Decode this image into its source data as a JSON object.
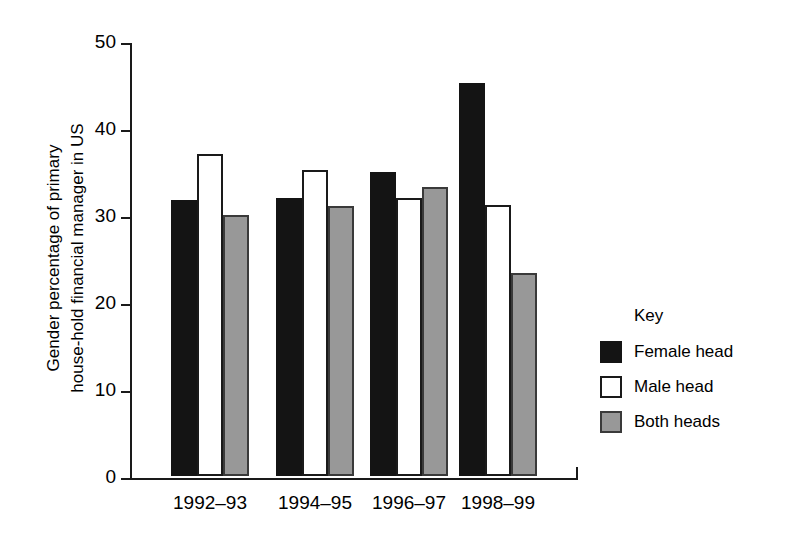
{
  "chart_data": {
    "type": "bar",
    "title": "",
    "subtitle": "",
    "xlabel": "",
    "ylabel": "Gender percentage of primary\nhouse-hold financial manager in US",
    "categories": [
      "1992–93",
      "1994–95",
      "1996–97",
      "1998–99"
    ],
    "series": [
      {
        "name": "Female head",
        "values": [
          31.7,
          32.0,
          35.0,
          45.2
        ],
        "color": "#141414"
      },
      {
        "name": "Male head",
        "values": [
          37.0,
          35.2,
          32.0,
          31.1
        ],
        "color": "#ffffff"
      },
      {
        "name": "Both heads",
        "values": [
          30.0,
          31.0,
          33.2,
          23.3
        ],
        "color": "#989898"
      }
    ],
    "ylim": [
      0,
      50
    ],
    "yticks": [
      0,
      10,
      20,
      30,
      40,
      50
    ],
    "ytick_labels": [
      "0",
      "10",
      "20",
      "30",
      "40",
      "50"
    ],
    "grid": false,
    "legend_position": "right"
  },
  "legend": {
    "title": "Key",
    "entries": [
      {
        "label": "Female head",
        "swatch": "female"
      },
      {
        "label": "Male head",
        "swatch": "male"
      },
      {
        "label": "Both heads",
        "swatch": "both"
      }
    ]
  },
  "colors": {
    "female_head": "#141414",
    "male_head": "#ffffff",
    "both_heads": "#989898",
    "axis": "#1a1a1a",
    "background": "#ffffff"
  }
}
